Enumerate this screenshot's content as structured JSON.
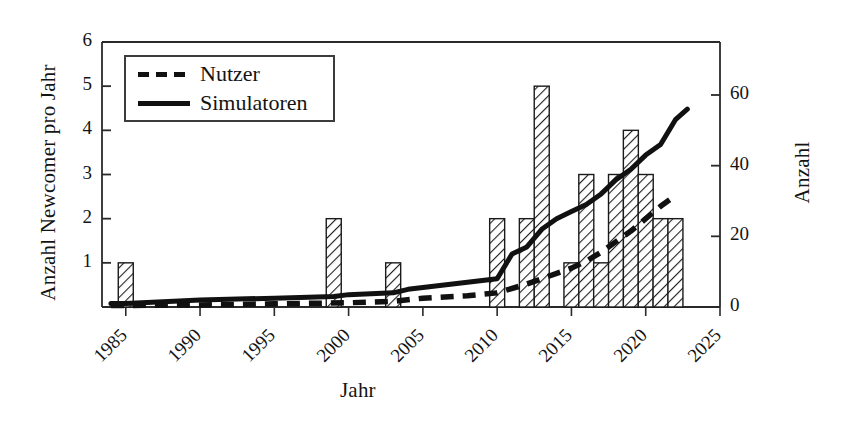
{
  "chart_data": {
    "type": "bar",
    "title": "",
    "xlabel": "Jahr",
    "ylabel": "Anzahl Newcomer pro Jahr",
    "ylabel_right": "Anzahl",
    "xlim": [
      1983.4,
      2025.0
    ],
    "ylim": [
      0,
      6
    ],
    "ylim_right": [
      0,
      75
    ],
    "grid": false,
    "legend_position": "upper-left",
    "x_ticks": [
      "1985",
      "1990",
      "1995",
      "2000",
      "2005",
      "2010",
      "2015",
      "2020",
      "2025"
    ],
    "x_tick_values": [
      1985,
      1990,
      1995,
      2000,
      2005,
      2010,
      2015,
      2020,
      2025
    ],
    "y_ticks_left": [
      "1",
      "2",
      "3",
      "4",
      "5",
      "6"
    ],
    "y_tick_values_left": [
      1,
      2,
      3,
      4,
      5,
      6
    ],
    "y_ticks_right": [
      "0",
      "20",
      "40",
      "60"
    ],
    "y_tick_values_right": [
      0,
      20,
      40,
      60
    ],
    "bars": {
      "name": "Newcomer pro Jahr",
      "axis": "left",
      "categories": [
        1985,
        1999,
        2003,
        2010,
        2012,
        2013,
        2015,
        2016,
        2017,
        2018,
        2019,
        2020,
        2021,
        2022
      ],
      "values": [
        1,
        2,
        1,
        2,
        2,
        5,
        1,
        3,
        1,
        3,
        4,
        3,
        2,
        2
      ],
      "fill": "hatched-diagonal",
      "edge_color": "#1a1a1a"
    },
    "series": [
      {
        "name": "Simulatoren",
        "style": "solid",
        "axis": "right",
        "color": "#111111",
        "x": [
          1984,
          1985,
          1990,
          1995,
          1999,
          2000,
          2003,
          2004,
          2005,
          2008,
          2009,
          2010,
          2011,
          2012,
          2013,
          2014,
          2015,
          2016,
          2017,
          2018,
          2019,
          2020,
          2021,
          2022,
          2022.8
        ],
        "y": [
          1,
          1,
          2,
          2.5,
          3,
          3.5,
          4,
          5,
          5.5,
          7,
          7.5,
          8,
          15,
          17,
          22,
          25,
          27,
          29,
          32,
          36,
          39,
          43,
          46,
          53,
          56
        ]
      },
      {
        "name": "Nutzer",
        "style": "dashed",
        "axis": "right",
        "color": "#111111",
        "x": [
          1984,
          1990,
          1995,
          2000,
          2003,
          2005,
          2008,
          2010,
          2012,
          2013,
          2015,
          2016,
          2017,
          2018,
          2019,
          2020,
          2021,
          2022
        ],
        "y": [
          0.4,
          0.6,
          0.9,
          1.2,
          1.6,
          2.5,
          3.2,
          4.0,
          6.5,
          8.0,
          11.0,
          13.0,
          15.5,
          18.5,
          21.5,
          25.0,
          28.5,
          31.5
        ]
      }
    ]
  },
  "legend": {
    "items": [
      {
        "label": "Nutzer",
        "style": "dashed"
      },
      {
        "label": "Simulatoren",
        "style": "solid"
      }
    ]
  }
}
